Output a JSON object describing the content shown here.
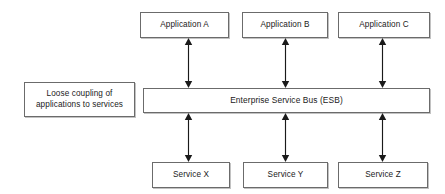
{
  "diagram": {
    "canvas": {
      "width": 445,
      "height": 194,
      "background": "#ffffff"
    },
    "colors": {
      "box_border": "#6b6b6b",
      "box_fill": "#ffffff",
      "text": "#1a1a1a",
      "arrow": "#1a1a1a",
      "shadow": "#787878"
    },
    "applications": [
      {
        "id": "app-a",
        "label": "Application A"
      },
      {
        "id": "app-b",
        "label": "Application B"
      },
      {
        "id": "app-c",
        "label": "Application C"
      }
    ],
    "bus": {
      "id": "esb",
      "label": "Enterprise Service Bus (ESB)"
    },
    "note": {
      "id": "note",
      "label": "Loose coupling of\napplications to services"
    },
    "services": [
      {
        "id": "svc-x",
        "label": "Service X"
      },
      {
        "id": "svc-y",
        "label": "Service Y"
      },
      {
        "id": "svc-z",
        "label": "Service Z"
      }
    ],
    "connectors": [
      {
        "id": "conn-app-a-esb",
        "from": "app-a",
        "to": "esb",
        "style": "double-arrow"
      },
      {
        "id": "conn-app-b-esb",
        "from": "app-b",
        "to": "esb",
        "style": "double-arrow"
      },
      {
        "id": "conn-app-c-esb",
        "from": "app-c",
        "to": "esb",
        "style": "double-arrow"
      },
      {
        "id": "conn-esb-svc-x",
        "from": "esb",
        "to": "svc-x",
        "style": "double-arrow"
      },
      {
        "id": "conn-esb-svc-y",
        "from": "esb",
        "to": "svc-y",
        "style": "double-arrow"
      },
      {
        "id": "conn-esb-svc-z",
        "from": "esb",
        "to": "svc-z",
        "style": "double-arrow"
      }
    ]
  }
}
